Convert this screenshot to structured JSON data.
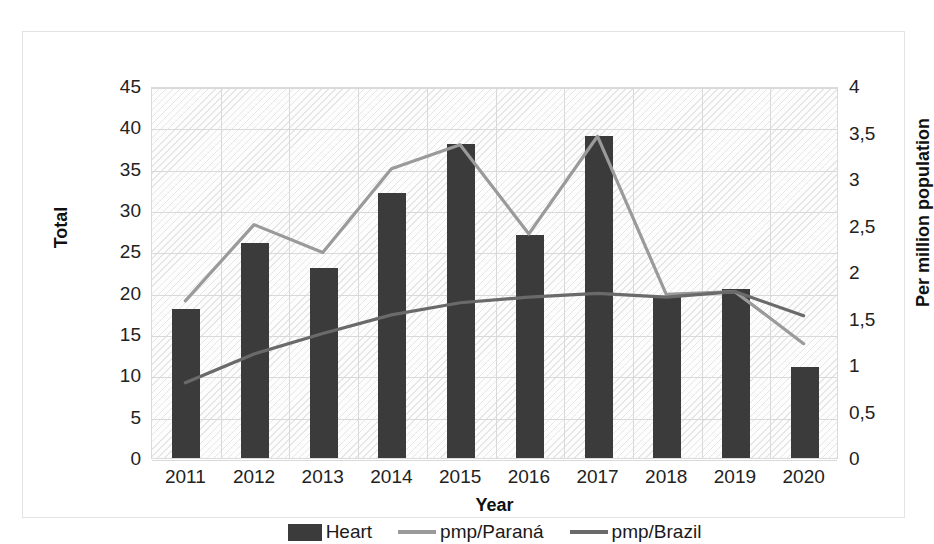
{
  "chart_data": {
    "type": "bar",
    "title": "",
    "subtitle": "",
    "xlabel": "Year",
    "ylabel": "Total",
    "y2label": "Per million population",
    "categories": [
      "2011",
      "2012",
      "2013",
      "2014",
      "2015",
      "2016",
      "2017",
      "2018",
      "2019",
      "2020"
    ],
    "ylim": [
      0,
      45
    ],
    "y2lim": [
      0,
      4
    ],
    "yticks": [
      "0",
      "5",
      "10",
      "15",
      "20",
      "25",
      "30",
      "35",
      "40",
      "45"
    ],
    "ytick_values": [
      0,
      5,
      10,
      15,
      20,
      25,
      30,
      35,
      40,
      45
    ],
    "y2ticks": [
      "0",
      "0,5",
      "1",
      "1,5",
      "2",
      "2,5",
      "3",
      "3,5",
      "4"
    ],
    "y2tick_values": [
      0,
      0.5,
      1,
      1.5,
      2,
      2.5,
      3,
      3.5,
      4
    ],
    "grid": true,
    "legend_position": "bottom",
    "series": [
      {
        "name": "Heart",
        "kind": "bar",
        "axis": "left",
        "color": "#3b3b3b",
        "values": [
          18,
          26,
          23,
          32,
          38,
          27,
          39,
          19.5,
          20.5,
          11
        ]
      },
      {
        "name": "pmp/Paraná",
        "kind": "line",
        "axis": "right",
        "color": "#9a9a9a",
        "values": [
          1.7,
          2.52,
          2.22,
          3.12,
          3.38,
          2.42,
          3.47,
          1.77,
          1.8,
          1.24
        ]
      },
      {
        "name": "pmp/Brazil",
        "kind": "line",
        "axis": "right",
        "color": "#6a6a6a",
        "values": [
          0.82,
          1.13,
          1.35,
          1.55,
          1.68,
          1.74,
          1.78,
          1.74,
          1.8,
          1.54
        ]
      }
    ]
  },
  "axes": {
    "left_title": "Total",
    "right_title": "Per million population",
    "bottom_title": "Year"
  },
  "legend": {
    "items": [
      {
        "label": "Heart",
        "swatch": "bar-swatch",
        "color": "#3b3b3b"
      },
      {
        "label": "pmp/Paraná",
        "swatch": "line-swatch",
        "color": "#9a9a9a"
      },
      {
        "label": "pmp/Brazil",
        "swatch": "line-swatch",
        "color": "#6a6a6a"
      }
    ]
  }
}
